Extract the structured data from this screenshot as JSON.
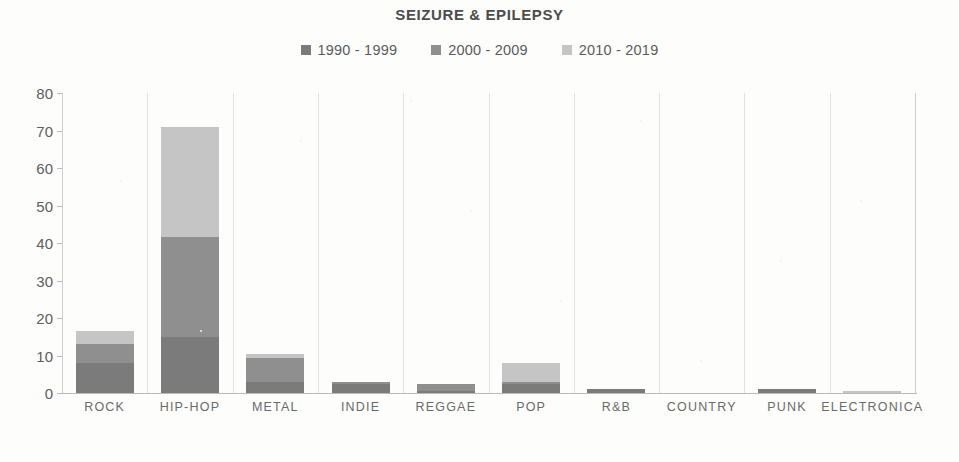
{
  "chart_data": {
    "type": "bar",
    "subtype": "stacked-vertical-bar",
    "title": "SEIZURE & EPILEPSY",
    "xlabel": "",
    "ylabel": "",
    "ylim": [
      0,
      80
    ],
    "ytick_step": 10,
    "yticks": [
      80,
      70,
      60,
      50,
      40,
      30,
      20,
      10,
      0
    ],
    "grid": "vertical-category-separators",
    "legend_position": "top-center",
    "categories": [
      "ROCK",
      "HIP-HOP",
      "METAL",
      "INDIE",
      "REGGAE",
      "POP",
      "R&B",
      "COUNTRY",
      "PUNK",
      "ELECTRONICA"
    ],
    "series": [
      {
        "name": "1990 - 1999",
        "color": "#7b7b7b",
        "values": [
          8,
          15,
          3,
          2.5,
          0.5,
          2.5,
          1,
          0,
          1,
          0
        ]
      },
      {
        "name": "2000 - 2009",
        "color": "#8f8f8f",
        "values": [
          5,
          26.5,
          6.3,
          0.5,
          2,
          0.5,
          0,
          0,
          0,
          0
        ]
      },
      {
        "name": "2010 - 2019",
        "color": "#c5c5c5",
        "values": [
          3.5,
          29.5,
          1.2,
          0,
          0,
          5,
          0,
          0,
          0,
          0.6
        ]
      }
    ],
    "totals": [
      16.5,
      71,
      10.5,
      3,
      2.5,
      8,
      1,
      0,
      1,
      0.6
    ]
  },
  "legend": {
    "items": [
      {
        "label": "1990 - 1999",
        "color": "#7b7b7b",
        "swatch": "square-marker"
      },
      {
        "label": "2000 - 2009",
        "color": "#8f8f8f",
        "swatch": "square-marker"
      },
      {
        "label": "2010 - 2019",
        "color": "#c5c5c5",
        "swatch": "square-marker"
      }
    ]
  },
  "colors": {
    "background": "#fdfdfc",
    "axis": "#bcbcbc",
    "gridline": "#e2e2e2",
    "text": "#5d5d5d",
    "title": "#4c4c4c"
  }
}
